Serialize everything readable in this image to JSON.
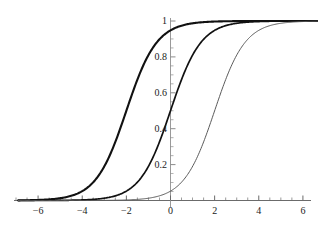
{
  "chart_data": {
    "type": "line",
    "title": "",
    "subtitle": "",
    "xlabel": "",
    "ylabel": "",
    "xlim": [
      -6.9,
      6.7
    ],
    "ylim": [
      0,
      1.02
    ],
    "grid": false,
    "legend": "none",
    "axis_style": "cross-hair axes at x=0 and y=0, Mathematica-style",
    "x_ticks": [
      {
        "value": -6,
        "label": "-6"
      },
      {
        "value": -4,
        "label": "-4"
      },
      {
        "value": -2,
        "label": "-2"
      },
      {
        "value": 0,
        "label": "0"
      },
      {
        "value": 2,
        "label": "2"
      },
      {
        "value": 4,
        "label": "4"
      },
      {
        "value": 6,
        "label": "6"
      }
    ],
    "x_minor_tick_step": 0.5,
    "y_ticks": [
      {
        "value": 0.2,
        "label": "0.2"
      },
      {
        "value": 0.4,
        "label": "0.4"
      },
      {
        "value": 0.6,
        "label": "0.6"
      },
      {
        "value": 0.8,
        "label": "0.8"
      },
      {
        "value": 1.0,
        "label": "1"
      }
    ],
    "y_minor_tick_step": 0.05,
    "series": [
      {
        "name": "curve-left",
        "description": "logistic sigmoid, midpoint -2",
        "midpoint": -2,
        "steepness": 1.45,
        "color": "#111111",
        "line_width": 2.1,
        "x": [
          -6.9,
          -6.0,
          -5.5,
          -5.0,
          -4.5,
          -4.0,
          -3.5,
          -3.0,
          -2.5,
          -2.0,
          -1.5,
          -1.0,
          -0.5,
          0.0,
          0.5,
          1.0,
          1.5,
          2.0,
          3.0,
          4.0,
          5.0,
          6.0,
          6.7
        ],
        "values": [
          0.001,
          0.003,
          0.007,
          0.013,
          0.026,
          0.052,
          0.101,
          0.189,
          0.327,
          0.5,
          0.673,
          0.811,
          0.899,
          0.948,
          0.974,
          0.987,
          0.993,
          0.997,
          0.999,
          1.0,
          1.0,
          1.0,
          1.0
        ]
      },
      {
        "name": "curve-center",
        "description": "logistic sigmoid, midpoint 0",
        "midpoint": 0,
        "steepness": 1.45,
        "color": "#111111",
        "line_width": 1.7,
        "x": [
          -6.9,
          -6.0,
          -5.0,
          -4.5,
          -4.0,
          -3.5,
          -3.0,
          -2.5,
          -2.0,
          -1.5,
          -1.0,
          -0.5,
          0.0,
          0.5,
          1.0,
          1.5,
          2.0,
          2.5,
          3.0,
          4.0,
          5.0,
          6.0,
          6.7
        ],
        "values": [
          0.0,
          0.0,
          0.001,
          0.001,
          0.003,
          0.006,
          0.013,
          0.026,
          0.052,
          0.101,
          0.189,
          0.327,
          0.5,
          0.673,
          0.811,
          0.899,
          0.948,
          0.974,
          0.987,
          0.997,
          0.999,
          1.0,
          1.0
        ]
      },
      {
        "name": "curve-right",
        "description": "logistic sigmoid, midpoint 2",
        "midpoint": 2,
        "steepness": 1.45,
        "color": "#5a5a5a",
        "line_width": 1.0,
        "x": [
          -6.9,
          -4.0,
          -3.0,
          -2.5,
          -2.0,
          -1.5,
          -1.0,
          -0.5,
          0.0,
          0.5,
          1.0,
          1.5,
          2.0,
          2.5,
          3.0,
          3.5,
          4.0,
          4.5,
          5.0,
          6.0,
          6.7
        ],
        "values": [
          0.0,
          0.0,
          0.001,
          0.001,
          0.003,
          0.006,
          0.013,
          0.026,
          0.052,
          0.101,
          0.189,
          0.327,
          0.5,
          0.673,
          0.811,
          0.899,
          0.948,
          0.974,
          0.987,
          0.997,
          0.999
        ]
      }
    ],
    "colors": {
      "axis": "#8c8c8c",
      "x_axis": "#6b6b6b",
      "text": "#1a1a1a",
      "background": "#ffffff"
    }
  }
}
